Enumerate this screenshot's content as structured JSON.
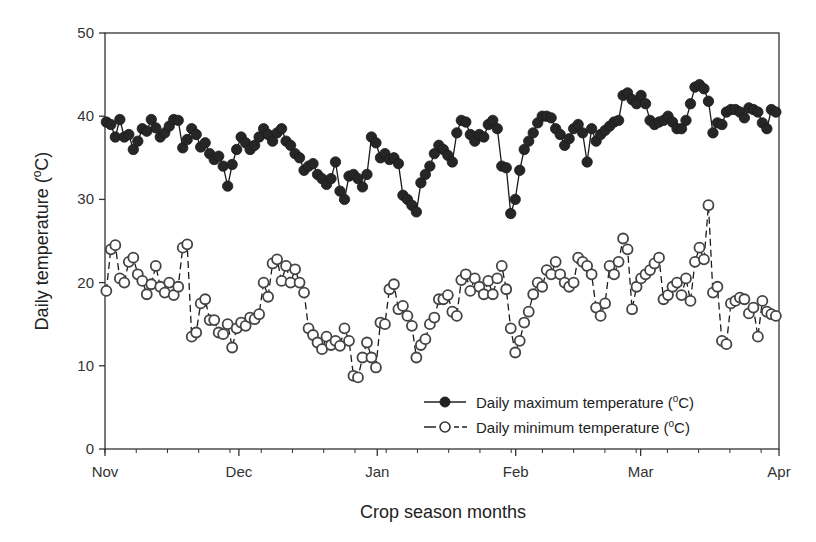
{
  "chart_data": {
    "type": "line",
    "title": "",
    "xlabel": "Crop season months",
    "ylabel": "Daily temperature (°C)",
    "ylabel_parts": {
      "main": "Daily temperature (",
      "sup": "o",
      "unit": "C)"
    },
    "ylim": [
      0,
      50
    ],
    "yticks": [
      0,
      10,
      20,
      30,
      40,
      50
    ],
    "xticks": [
      "Nov",
      "Dec",
      "Jan",
      "Feb",
      "Mar",
      "Apr"
    ],
    "xtick_days": [
      0,
      30,
      61,
      92,
      120,
      151
    ],
    "grid": false,
    "legend_position": "lower right (inside plot)",
    "series": [
      {
        "name": "Daily maximum temperature (°C)",
        "legend_parts": {
          "main": "Daily maximum temperature (",
          "sup": "o",
          "unit": "C)"
        },
        "marker": "filled-circle",
        "line": "solid",
        "color": "#1a1a1a",
        "values": [
          39.3,
          39.0,
          37.5,
          39.6,
          37.5,
          37.8,
          36.0,
          37.0,
          38.5,
          38.2,
          39.6,
          38.6,
          37.5,
          38.0,
          38.8,
          39.6,
          39.5,
          36.2,
          37.2,
          38.5,
          37.8,
          36.3,
          36.8,
          35.5,
          34.8,
          35.2,
          34.0,
          31.6,
          34.2,
          36.0,
          37.5,
          36.8,
          36.0,
          36.5,
          37.5,
          38.5,
          37.8,
          37.0,
          38.0,
          38.5,
          37.0,
          36.5,
          35.5,
          35.0,
          33.5,
          34.0,
          34.3,
          33.0,
          32.5,
          31.8,
          32.5,
          34.5,
          31.0,
          30.0,
          32.8,
          33.0,
          32.5,
          31.5,
          33.0,
          37.5,
          36.8,
          35.0,
          35.5,
          34.8,
          35.0,
          34.3,
          30.5,
          30.0,
          29.3,
          28.5,
          32.0,
          33.0,
          34.0,
          35.5,
          36.5,
          36.0,
          35.3,
          34.5,
          38.0,
          39.5,
          39.3,
          37.8,
          37.0,
          37.8,
          37.5,
          39.0,
          39.5,
          38.5,
          34.0,
          33.8,
          28.3,
          30.0,
          33.5,
          36.0,
          37.0,
          38.0,
          39.2,
          40.0,
          40.0,
          39.8,
          38.5,
          37.8,
          36.5,
          37.3,
          38.5,
          39.0,
          38.0,
          34.5,
          38.5,
          37.0,
          37.8,
          38.3,
          38.8,
          39.3,
          39.5,
          42.5,
          42.8,
          42.0,
          41.5,
          42.5,
          41.5,
          39.5,
          39.0,
          39.3,
          39.5,
          40.0,
          39.3,
          38.5,
          38.5,
          39.5,
          41.5,
          43.5,
          43.8,
          43.3,
          41.8,
          38.0,
          39.2,
          39.0,
          40.5,
          40.8,
          40.8,
          40.5,
          39.8,
          41.0,
          40.8,
          40.5,
          39.2,
          38.5,
          40.8,
          40.5
        ]
      },
      {
        "name": "Daily minimum temperature (°C)",
        "legend_parts": {
          "main": "Daily minimum temperature (",
          "sup": "o",
          "unit": "C)"
        },
        "marker": "open-circle",
        "line": "dashed",
        "color": "#1a1a1a",
        "values": [
          19.0,
          24.0,
          24.5,
          20.5,
          20.0,
          22.5,
          23.0,
          21.0,
          20.2,
          18.6,
          19.8,
          22.0,
          19.5,
          18.8,
          20.0,
          18.5,
          19.5,
          24.2,
          24.6,
          13.5,
          14.0,
          17.5,
          18.0,
          15.5,
          15.5,
          14.0,
          13.8,
          15.0,
          12.2,
          14.5,
          15.2,
          14.8,
          15.8,
          15.6,
          16.2,
          20.0,
          18.3,
          22.3,
          22.8,
          20.2,
          22.0,
          20.0,
          21.6,
          20.0,
          18.8,
          14.5,
          13.7,
          12.8,
          12.0,
          13.5,
          12.5,
          13.0,
          12.4,
          14.5,
          13.0,
          8.8,
          8.6,
          11.0,
          12.8,
          11.0,
          9.8,
          15.2,
          15.0,
          19.2,
          19.8,
          16.8,
          17.2,
          16.0,
          14.8,
          11.0,
          12.5,
          13.2,
          15.0,
          15.8,
          18.0,
          18.0,
          18.5,
          16.5,
          16.0,
          20.3,
          21.0,
          19.0,
          20.5,
          19.5,
          18.6,
          20.2,
          18.6,
          20.5,
          22.0,
          19.2,
          14.5,
          11.6,
          13.0,
          15.2,
          16.5,
          18.6,
          20.0,
          19.5,
          21.5,
          21.0,
          22.5,
          21.0,
          20.0,
          19.5,
          20.0,
          23.0,
          22.5,
          22.0,
          21.0,
          17.0,
          16.0,
          17.5,
          22.0,
          21.0,
          22.5,
          25.3,
          24.0,
          16.8,
          19.5,
          20.5,
          21.0,
          21.5,
          22.3,
          23.0,
          18.0,
          18.5,
          19.5,
          20.0,
          18.5,
          20.5,
          17.8,
          22.5,
          24.2,
          22.8,
          29.3,
          18.8,
          19.5,
          13.0,
          12.6,
          17.5,
          17.8,
          18.2,
          18.0,
          16.3,
          17.0,
          13.5,
          17.8,
          16.5,
          16.2,
          16.0
        ]
      }
    ]
  },
  "colors": {
    "axis": "#333333",
    "marker_fill_max": "#262626",
    "marker_stroke": "#444444",
    "background": "#ffffff"
  }
}
